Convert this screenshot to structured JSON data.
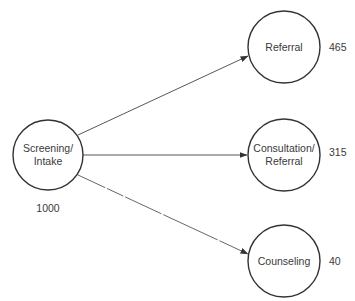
{
  "diagram": {
    "type": "flow",
    "source": {
      "id": "screening",
      "label_line1": "Screening/",
      "label_line2": "Intake",
      "count": "1000"
    },
    "targets": [
      {
        "id": "referral",
        "label_line1": "Referral",
        "label_line2": "",
        "count": "465"
      },
      {
        "id": "consultation",
        "label_line1": "Consultation/",
        "label_line2": "Referral",
        "count": "315"
      },
      {
        "id": "counseling",
        "label_line1": "Counseling",
        "label_line2": "",
        "count": "40"
      }
    ],
    "colors": {
      "stroke": "#333333",
      "text": "#3a3a3a",
      "background": "#ffffff"
    }
  }
}
